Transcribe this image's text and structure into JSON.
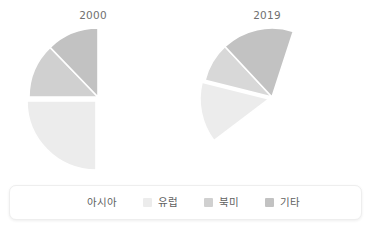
{
  "chart_data": {
    "type": "pie",
    "title": "",
    "subtitle": "",
    "xlabel": "",
    "ylabel": "",
    "grid": false,
    "legend_position": "bottom",
    "categories": [
      "아시아",
      "유럽",
      "북미",
      "기타"
    ],
    "category_colors": [
      "#f2f2f2",
      "#dcdcdc",
      "#c6c6c6",
      "#b0b0b0"
    ],
    "charts": [
      {
        "title": "2000",
        "center_x": 98,
        "center_y": 97,
        "radius": 69,
        "slices": [
          {
            "label": "아시아",
            "value": 25,
            "color": "#ececec",
            "start_angle": 90,
            "end_angle": 180,
            "explode_x": -2,
            "explode_y": 4
          },
          {
            "label": "유럽",
            "value": 13,
            "color": "#d0d0d0",
            "start_angle": 180,
            "end_angle": 226,
            "explode_x": 0,
            "explode_y": 0
          },
          {
            "label": "북미",
            "value": 12,
            "color": "#c2c2c2",
            "start_angle": 226,
            "end_angle": 270,
            "explode_x": 0,
            "explode_y": 0
          },
          {
            "label": "기타",
            "value": 0,
            "color": "#b0b0b0",
            "start_angle": 270,
            "end_angle": 270,
            "explode_x": 0,
            "explode_y": 0
          }
        ]
      },
      {
        "title": "2019",
        "center_x": 98,
        "center_y": 97,
        "radius": 69,
        "slices": [
          {
            "label": "아시아",
            "value": 14,
            "color": "#ececec",
            "start_angle": 143,
            "end_angle": 194,
            "explode_x": -3,
            "explode_y": 2
          },
          {
            "label": "유럽",
            "value": 9,
            "color": "#d8d8d8",
            "start_angle": 194,
            "end_angle": 227,
            "explode_x": 0,
            "explode_y": 0
          },
          {
            "label": "북미",
            "value": 17,
            "color": "#c2c2c2",
            "start_angle": 227,
            "end_angle": 288,
            "explode_x": 0,
            "explode_y": 0
          },
          {
            "label": "기타",
            "value": 0,
            "color": "#b0b0b0",
            "start_angle": 288,
            "end_angle": 288,
            "explode_x": 0,
            "explode_y": 0
          }
        ]
      }
    ]
  },
  "legend": {
    "items": [
      {
        "label": "아시아",
        "color": "#ffffff",
        "show_swatch": false
      },
      {
        "label": "유럽",
        "color": "#ececec",
        "show_swatch": true
      },
      {
        "label": "북미",
        "color": "#d0d0d0",
        "show_swatch": true
      },
      {
        "label": "기타",
        "color": "#c2c2c2",
        "show_swatch": true
      }
    ]
  }
}
